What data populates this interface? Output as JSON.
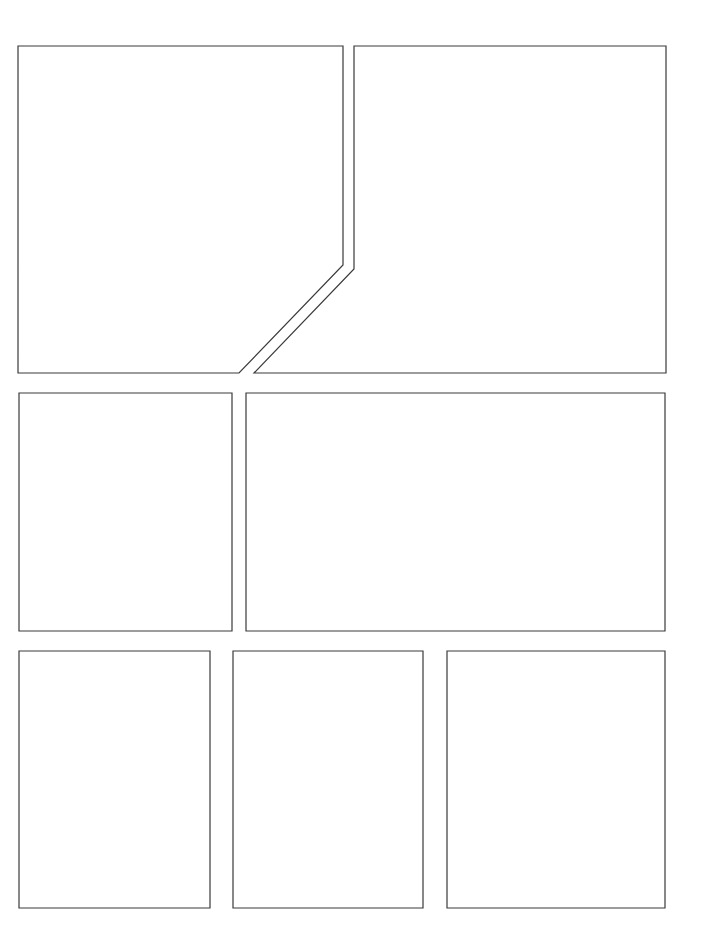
{
  "page": {
    "type": "comic-page-template",
    "background": "#ffffff",
    "border_color": "#3a3a3a",
    "panel_count": 7
  },
  "panels": [
    {
      "id": 1,
      "shape": "polygon",
      "points": "18,46 343,46 343,265 239,373 18,373"
    },
    {
      "id": 2,
      "shape": "polygon",
      "points": "354,46 666,46 666,373 254,373 354,269"
    },
    {
      "id": 3,
      "shape": "rect",
      "points": "19,393 232,393 232,631 19,631"
    },
    {
      "id": 4,
      "shape": "rect",
      "points": "246,393 665,393 665,631 246,631"
    },
    {
      "id": 5,
      "shape": "rect",
      "points": "19,651 210,651 210,908 19,908"
    },
    {
      "id": 6,
      "shape": "rect",
      "points": "233,651 423,651 423,908 233,908"
    },
    {
      "id": 7,
      "shape": "rect",
      "points": "447,651 665,651 665,908 447,908"
    }
  ]
}
